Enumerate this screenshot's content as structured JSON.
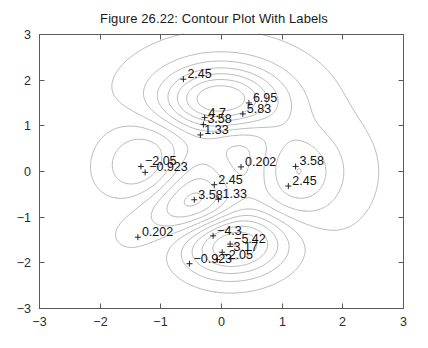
{
  "figure": {
    "title": "Figure 26.22: Contour Plot With Labels",
    "width": 428,
    "height": 348,
    "background_color": "#ffffff"
  },
  "axes": {
    "box_color": "#5a5a5a",
    "contour_color": "#a8a8a8",
    "label_color": "#111111",
    "plot_left": 39,
    "plot_top": 34,
    "plot_right": 403,
    "plot_bottom": 308,
    "x": {
      "min": -3,
      "max": 3,
      "ticks": [
        -3,
        -2,
        -1,
        0,
        1,
        2,
        3
      ],
      "tick_labels": [
        "-3",
        "-2",
        "-1",
        "0",
        "1",
        "2",
        "3"
      ],
      "label": ""
    },
    "y": {
      "min": -3,
      "max": 3,
      "ticks": [
        -3,
        -2,
        -1,
        0,
        1,
        2,
        3
      ],
      "tick_labels": [
        "-3",
        "-2",
        "-1",
        "0",
        "1",
        "2",
        "3"
      ],
      "label": ""
    }
  },
  "chart_data": {
    "type": "contour",
    "title": "Figure 26.22: Contour Plot With Labels",
    "xlabel": "",
    "ylabel": "",
    "xlim": [
      -3,
      3
    ],
    "ylim": [
      -3,
      3
    ],
    "grid": false,
    "legend": false,
    "surface_function": "peaks",
    "levels": [
      -6.54,
      -5.42,
      -4.3,
      -3.17,
      -2.05,
      -0.923,
      0.202,
      1.33,
      2.45,
      3.58,
      4.7,
      5.83,
      6.95
    ],
    "contour_labels": [
      {
        "value": "2.45",
        "x": -0.62,
        "y": 2.01
      },
      {
        "value": "6.95",
        "x": 0.46,
        "y": 1.49
      },
      {
        "value": "5.83",
        "x": 0.36,
        "y": 1.25
      },
      {
        "value": "4.7",
        "x": -0.27,
        "y": 1.17
      },
      {
        "value": "3.58",
        "x": -0.29,
        "y": 1.02
      },
      {
        "value": "1.33",
        "x": -0.34,
        "y": 0.79
      },
      {
        "value": "-2.05",
        "x": -1.32,
        "y": 0.1
      },
      {
        "value": "-0.923",
        "x": -1.25,
        "y": -0.03
      },
      {
        "value": "0.202",
        "x": 0.33,
        "y": 0.09
      },
      {
        "value": "3.58",
        "x": 1.23,
        "y": 0.1
      },
      {
        "value": "2.45",
        "x": -0.11,
        "y": -0.3
      },
      {
        "value": "2.45",
        "x": 1.11,
        "y": -0.33
      },
      {
        "value": "3.58",
        "x": -0.44,
        "y": -0.63
      },
      {
        "value": "1.33",
        "x": -0.04,
        "y": -0.62
      },
      {
        "value": "0.202",
        "x": -1.37,
        "y": -1.45
      },
      {
        "value": "-4.3",
        "x": -0.13,
        "y": -1.42
      },
      {
        "value": "-5.42",
        "x": 0.15,
        "y": -1.6
      },
      {
        "value": "-3.17",
        "x": 0.02,
        "y": -1.78
      },
      {
        "value": "-2.05",
        "x": -0.06,
        "y": -1.94
      },
      {
        "value": "-0.923",
        "x": -0.52,
        "y": -2.03
      }
    ]
  }
}
